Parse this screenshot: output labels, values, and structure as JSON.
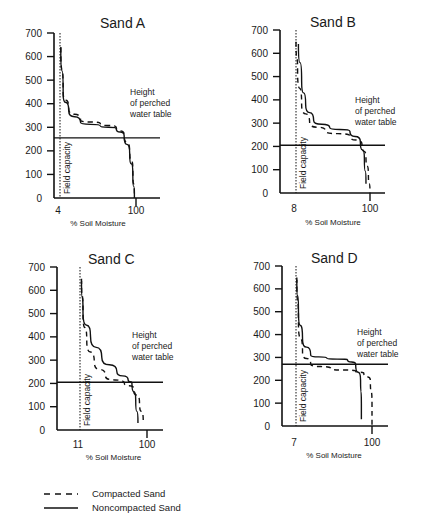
{
  "chart_data": [
    {
      "type": "line",
      "title": "Sand A",
      "xlabel": "% Soil Moisture",
      "ylabel": "",
      "x_ticks": [
        "4",
        "100"
      ],
      "y_ticks": [
        0,
        100,
        200,
        300,
        400,
        500,
        600,
        700
      ],
      "ylim": [
        0,
        700
      ],
      "field_capacity_label": "Field capacity",
      "field_capacity_x": 4,
      "perched_water_table_label": "Height of perched water table",
      "perched_water_table_height": 255,
      "series": [
        {
          "name": "Compacted Sand",
          "style": "dashed",
          "points": [
            [
              5,
              640
            ],
            [
              8,
              450
            ],
            [
              15,
              380
            ],
            [
              30,
              330
            ],
            [
              55,
              315
            ],
            [
              75,
              300
            ],
            [
              85,
              270
            ],
            [
              92,
              200
            ],
            [
              96,
              120
            ],
            [
              98,
              0
            ]
          ]
        },
        {
          "name": "Noncompacted Sand",
          "style": "solid",
          "points": [
            [
              5,
              640
            ],
            [
              8,
              440
            ],
            [
              15,
              370
            ],
            [
              30,
              320
            ],
            [
              55,
              305
            ],
            [
              75,
              295
            ],
            [
              85,
              265
            ],
            [
              92,
              190
            ],
            [
              96,
              100
            ],
            [
              98,
              0
            ]
          ]
        }
      ]
    },
    {
      "type": "line",
      "title": "Sand B",
      "xlabel": "% Soil Moisture",
      "ylabel": "",
      "x_ticks": [
        "8",
        "100"
      ],
      "y_ticks": [
        0,
        100,
        200,
        300,
        400,
        500,
        600,
        700
      ],
      "ylim": [
        0,
        700
      ],
      "field_capacity_label": "Field capacity",
      "field_capacity_x": 8,
      "perched_water_table_label": "Height of perched water table",
      "perched_water_table_height": 205,
      "series": [
        {
          "name": "Compacted Sand",
          "style": "dashed",
          "points": [
            [
              8,
              650
            ],
            [
              10,
              520
            ],
            [
              15,
              380
            ],
            [
              25,
              300
            ],
            [
              45,
              265
            ],
            [
              75,
              245
            ],
            [
              90,
              210
            ],
            [
              95,
              150
            ],
            [
              98,
              80
            ],
            [
              100,
              0
            ]
          ]
        },
        {
          "name": "Noncompacted Sand",
          "style": "solid",
          "points": [
            [
              11,
              640
            ],
            [
              15,
              480
            ],
            [
              20,
              380
            ],
            [
              30,
              310
            ],
            [
              50,
              280
            ],
            [
              75,
              265
            ],
            [
              88,
              220
            ],
            [
              93,
              150
            ],
            [
              95,
              40
            ]
          ]
        }
      ]
    },
    {
      "type": "line",
      "title": "Sand C",
      "xlabel": "% Soil Moisture",
      "ylabel": "",
      "x_ticks": [
        "11",
        "100"
      ],
      "y_ticks": [
        0,
        100,
        200,
        300,
        400,
        500,
        600,
        700
      ],
      "ylim": [
        0,
        700
      ],
      "field_capacity_label": "Field capacity",
      "field_capacity_x": 11,
      "perched_water_table_label": "Height of perched water table",
      "perched_water_table_height": 205,
      "series": [
        {
          "name": "Compacted Sand",
          "style": "dashed",
          "points": [
            [
              13,
              650
            ],
            [
              15,
              500
            ],
            [
              20,
              380
            ],
            [
              30,
              290
            ],
            [
              45,
              230
            ],
            [
              70,
              200
            ],
            [
              82,
              180
            ],
            [
              90,
              120
            ],
            [
              95,
              40
            ]
          ]
        },
        {
          "name": "Noncompacted Sand",
          "style": "solid",
          "points": [
            [
              13,
              640
            ],
            [
              15,
              500
            ],
            [
              25,
              400
            ],
            [
              40,
              310
            ],
            [
              60,
              250
            ],
            [
              75,
              215
            ],
            [
              80,
              200
            ],
            [
              85,
              130
            ],
            [
              88,
              30
            ]
          ]
        }
      ]
    },
    {
      "type": "line",
      "title": "Sand D",
      "xlabel": "% Soil Moisture",
      "ylabel": "",
      "x_ticks": [
        "7",
        "100"
      ],
      "y_ticks": [
        0,
        100,
        200,
        300,
        400,
        500,
        600,
        700
      ],
      "ylim": [
        0,
        700
      ],
      "field_capacity_label": "Field capacity",
      "field_capacity_x": 7,
      "perched_water_table_label": "Height of perched water table",
      "perched_water_table_height": 270,
      "series": [
        {
          "name": "Compacted Sand",
          "style": "dashed",
          "points": [
            [
              8,
              650
            ],
            [
              10,
              450
            ],
            [
              15,
              320
            ],
            [
              25,
              270
            ],
            [
              50,
              250
            ],
            [
              80,
              240
            ],
            [
              90,
              230
            ],
            [
              98,
              200
            ],
            [
              100,
              100
            ],
            [
              100,
              0
            ]
          ]
        },
        {
          "name": "Noncompacted Sand",
          "style": "solid",
          "points": [
            [
              8,
              640
            ],
            [
              10,
              500
            ],
            [
              15,
              380
            ],
            [
              25,
              310
            ],
            [
              45,
              295
            ],
            [
              70,
              290
            ],
            [
              80,
              270
            ],
            [
              86,
              200
            ],
            [
              87,
              100
            ],
            [
              87,
              30
            ]
          ]
        }
      ]
    }
  ],
  "legend": {
    "items": [
      {
        "label": "Compacted Sand",
        "style": "dashed"
      },
      {
        "label": "Noncompacted Sand",
        "style": "solid"
      }
    ]
  }
}
